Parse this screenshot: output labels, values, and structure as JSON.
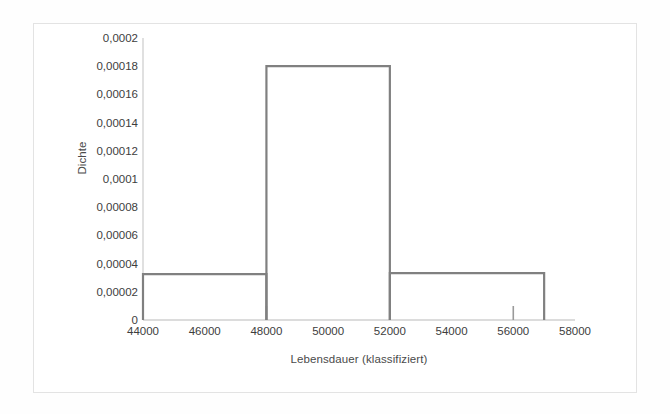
{
  "chart_data": {
    "type": "bar",
    "subtype": "histogram-density",
    "title": "",
    "xlabel": "Lebensdauer (klassifiziert)",
    "ylabel": "Dichte",
    "xlim": [
      44000,
      58000
    ],
    "ylim": [
      0,
      0.0002
    ],
    "grid": false,
    "legend": null,
    "bar_style": "outline-only",
    "line_color": "#808080",
    "x_tick_values": [
      44000,
      46000,
      48000,
      50000,
      52000,
      54000,
      56000,
      58000
    ],
    "x_tick_labels": [
      "44000",
      "46000",
      "48000",
      "50000",
      "52000",
      "54000",
      "56000",
      "58000"
    ],
    "x_major_tick_marks": [
      44000,
      48000,
      52000,
      56000
    ],
    "y_tick_values": [
      0,
      2e-05,
      4e-05,
      6e-05,
      8e-05,
      0.0001,
      0.00012,
      0.00014,
      0.00016,
      0.00018,
      0.0002
    ],
    "y_tick_labels": [
      "0",
      "0,00002",
      "0,00004",
      "0,00006",
      "0,00008",
      "0,0001",
      "0,00012",
      "0,00014",
      "0,00016",
      "0,00018",
      "0,0002"
    ],
    "bins": [
      {
        "label": "44000-48000",
        "x_start": 44000,
        "x_end": 48000,
        "density": 3.25e-05
      },
      {
        "label": "48000-52000",
        "x_start": 48000,
        "x_end": 52000,
        "density": 0.00018
      },
      {
        "label": "52000-57000",
        "x_start": 52000,
        "x_end": 57000,
        "density": 3.33e-05
      }
    ],
    "categories": [
      "44000-48000",
      "48000-52000",
      "52000-57000"
    ],
    "values": [
      3.25e-05,
      0.00018,
      3.33e-05
    ]
  },
  "figure": {
    "frame_color": "#e3e3e3",
    "background": "#ffffff",
    "axis_color": "#d0d0d0"
  }
}
